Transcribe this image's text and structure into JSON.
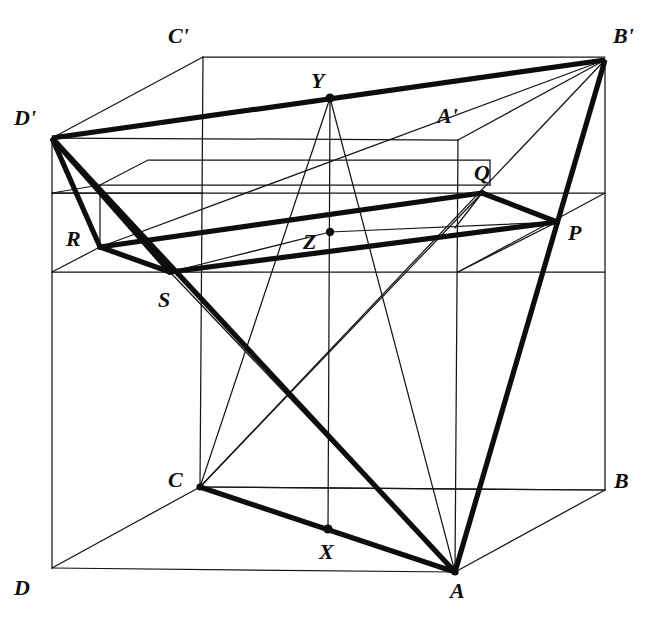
{
  "figure": {
    "background_color": "#ffffff",
    "ink_color": "#0d0d0d",
    "thin_stroke_width": 1.25,
    "thick_stroke_width": 5.2,
    "width": 660,
    "height": 633
  },
  "labels": [
    {
      "name": "label-C-prime",
      "text": "C'",
      "x": 168,
      "y": 25
    },
    {
      "name": "label-B-prime",
      "text": "B'",
      "x": 613,
      "y": 25
    },
    {
      "name": "label-Y",
      "text": "Y",
      "x": 311,
      "y": 70
    },
    {
      "name": "label-D-prime",
      "text": "D'",
      "x": 14,
      "y": 107
    },
    {
      "name": "label-A-prime",
      "text": "A'",
      "x": 437,
      "y": 105
    },
    {
      "name": "label-Q",
      "text": "Q",
      "x": 474,
      "y": 162
    },
    {
      "name": "label-P",
      "text": "P",
      "x": 568,
      "y": 222
    },
    {
      "name": "label-R",
      "text": "R",
      "x": 66,
      "y": 228
    },
    {
      "name": "label-Z",
      "text": "Z",
      "x": 303,
      "y": 231
    },
    {
      "name": "label-S",
      "text": "S",
      "x": 158,
      "y": 289
    },
    {
      "name": "label-C",
      "text": "C",
      "x": 168,
      "y": 469
    },
    {
      "name": "label-B",
      "text": "B",
      "x": 614,
      "y": 470
    },
    {
      "name": "label-X",
      "text": "X",
      "x": 319,
      "y": 541
    },
    {
      "name": "label-D",
      "text": "D",
      "x": 14,
      "y": 577
    },
    {
      "name": "label-A",
      "text": "A",
      "x": 450,
      "y": 580
    }
  ],
  "vertices": {
    "A": {
      "x": 455,
      "y": 572
    },
    "B": {
      "x": 605,
      "y": 490
    },
    "C": {
      "x": 200,
      "y": 487
    },
    "D": {
      "x": 52,
      "y": 568
    },
    "A_prime": {
      "x": 458,
      "y": 140
    },
    "B_prime": {
      "x": 605,
      "y": 60
    },
    "C_prime": {
      "x": 203,
      "y": 57
    },
    "D_prime": {
      "x": 52,
      "y": 138
    },
    "P": {
      "x": 557,
      "y": 222
    },
    "Q": {
      "x": 482,
      "y": 193
    },
    "R": {
      "x": 100,
      "y": 247
    },
    "S": {
      "x": 170,
      "y": 272
    },
    "X": {
      "x": 328,
      "y": 529
    },
    "Y": {
      "x": 330,
      "y": 98
    },
    "Z": {
      "x": 330,
      "y": 232
    }
  },
  "thin_edges": [
    {
      "name": "edge-D-A",
      "from": "D",
      "to": "A"
    },
    {
      "name": "edge-A-B",
      "from": "A",
      "to": "B"
    },
    {
      "name": "edge-D-C",
      "from": "D",
      "to": "C"
    },
    {
      "name": "edge-C-B",
      "from": "C",
      "to": "B"
    },
    {
      "name": "edge-D-D-prime",
      "from": "D",
      "to": "D_prime"
    },
    {
      "name": "edge-A-A-prime",
      "from": "A",
      "to": "A_prime"
    },
    {
      "name": "edge-B-B-prime",
      "from": "B",
      "to": "B_prime"
    },
    {
      "name": "edge-C-C-prime",
      "from": "C",
      "to": "C_prime"
    },
    {
      "name": "edge-D-prime-A-prime",
      "from": "D_prime",
      "to": "A_prime"
    },
    {
      "name": "edge-A-prime-B-prime",
      "from": "A_prime",
      "to": "B_prime"
    },
    {
      "name": "edge-D-prime-C-prime",
      "from": "D_prime",
      "to": "C_prime"
    },
    {
      "name": "edge-C-prime-B-prime",
      "from": "C_prime",
      "to": "B_prime"
    },
    {
      "name": "diagonal-A-B-prime",
      "from": "A",
      "to": "B_prime"
    },
    {
      "name": "diagonal-C-B-prime",
      "from": "C",
      "to": "B_prime"
    },
    {
      "name": "segment-Y-A",
      "from": "Y",
      "to": "A"
    },
    {
      "name": "segment-Y-C",
      "from": "Y",
      "to": "C"
    },
    {
      "name": "segment-Y-X",
      "from": "Y",
      "to": "X"
    },
    {
      "name": "segment-R-B-prime",
      "from": "R",
      "to": "B_prime"
    },
    {
      "name": "segment-S-Z",
      "from": "S",
      "to": "Z"
    },
    {
      "name": "segment-Z-P",
      "from": "Z",
      "to": "P"
    },
    {
      "name": "segment-Q-plane",
      "from": "Q",
      "to": "Z"
    }
  ],
  "thick_edges": [
    {
      "name": "thick-D-prime-B-prime",
      "from": "D_prime",
      "to": "B_prime"
    },
    {
      "name": "thick-D-prime-S",
      "from": "D_prime",
      "to": "S"
    },
    {
      "name": "thick-D-prime-R",
      "from": "D_prime",
      "to": "R"
    },
    {
      "name": "thick-D-prime-A",
      "from": "D_prime",
      "to": "A"
    },
    {
      "name": "thick-B-prime-A",
      "from": "B_prime",
      "to": "A"
    },
    {
      "name": "thick-C-A",
      "from": "C",
      "to": "A"
    },
    {
      "name": "thick-R-Q",
      "from": "R",
      "to": "Q"
    },
    {
      "name": "thick-S-P",
      "from": "S",
      "to": "P"
    },
    {
      "name": "thick-R-S",
      "from": "R",
      "to": "S"
    },
    {
      "name": "thick-Q-P",
      "from": "Q",
      "to": "P"
    }
  ],
  "dots": [
    {
      "name": "dot-Y",
      "at": "Y",
      "r": 4.2
    },
    {
      "name": "dot-X",
      "at": "X",
      "r": 4.2
    },
    {
      "name": "dot-Z",
      "at": "Z",
      "r": 4.0
    },
    {
      "name": "dot-C",
      "at": "C",
      "r": 3.4
    },
    {
      "name": "dot-A",
      "at": "A",
      "r": 3.4
    }
  ],
  "inner_plane": {
    "name": "inner-section-plane",
    "top_rail_y": 193,
    "bottom_rail_y": 272,
    "description": "Horizontal mid-cube section plane drawn with thin parallelogram rails"
  }
}
